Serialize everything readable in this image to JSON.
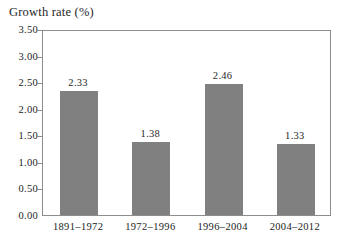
{
  "chart_data": {
    "type": "bar",
    "title": "Growth rate (%)",
    "xlabel": "",
    "ylabel": "Growth rate (%)",
    "categories": [
      "1891–1972",
      "1972–1996",
      "1996–2004",
      "2004–2012"
    ],
    "values": [
      2.33,
      1.38,
      2.46,
      1.33
    ],
    "value_labels": [
      "2.33",
      "1.38",
      "2.46",
      "1.33"
    ],
    "ylim": [
      0.0,
      3.5
    ],
    "ytick_values": [
      0.0,
      0.5,
      1.0,
      1.5,
      2.0,
      2.5,
      3.0,
      3.5
    ],
    "ytick_labels": [
      "0.00",
      "0.50",
      "1.00",
      "1.50",
      "2.00",
      "2.50",
      "3.00",
      "3.50"
    ],
    "grid": false,
    "legend": null,
    "legend_position": "none",
    "series": [
      {
        "name": "Growth rate",
        "values": [
          2.33,
          1.38,
          2.46,
          1.33
        ],
        "color": "#808080"
      }
    ]
  },
  "colors": {
    "bar_fill": "#808080",
    "frame": "#8d8d8d",
    "text": "#1f1f1f",
    "background": "#ffffff"
  }
}
